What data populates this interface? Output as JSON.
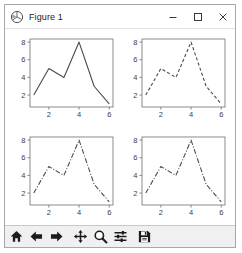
{
  "window": {
    "title": "Figure 1",
    "app_icon": "matplotlib-logo-icon",
    "controls": {
      "minimize": "Minimize",
      "maximize": "Maximize",
      "close": "Close"
    }
  },
  "toolbar": {
    "buttons": [
      {
        "name": "home-button",
        "icon": "home-icon",
        "label": "Home"
      },
      {
        "name": "back-button",
        "icon": "arrow-left-icon",
        "label": "Back"
      },
      {
        "name": "forward-button",
        "icon": "arrow-right-icon",
        "label": "Forward"
      },
      {
        "name": "pan-button",
        "icon": "move-cross-icon",
        "label": "Pan"
      },
      {
        "name": "zoom-button",
        "icon": "magnifier-icon",
        "label": "Zoom"
      },
      {
        "name": "configure-subplots-button",
        "icon": "sliders-icon",
        "label": "Configure subplots"
      },
      {
        "name": "save-button",
        "icon": "floppy-disk-icon",
        "label": "Save"
      }
    ]
  },
  "colors": {
    "line": "#4a4a4a",
    "axis": "#6e6e6e",
    "tick_label": "#3c3c3c",
    "figure_background": "#ffffff",
    "toolbar_background": "#f0f0f0",
    "window_border": "#a8a8a8"
  },
  "chart_data": [
    {
      "type": "line",
      "title": "",
      "subplot_position": "top-left",
      "linestyle": "solid",
      "color": "#4a4a4a",
      "x": [
        1,
        2,
        3,
        4,
        5,
        6
      ],
      "values": [
        2,
        5,
        4,
        8,
        3,
        1
      ],
      "xlabel": "",
      "ylabel": "",
      "xlim": [
        0.75,
        6.25
      ],
      "ylim": [
        0.65,
        8.35
      ],
      "xticks": [
        2,
        4,
        6
      ],
      "yticks": [
        2,
        4,
        6,
        8
      ],
      "xticklabels": [
        "2",
        "4",
        "6"
      ],
      "yticklabels": [
        "2",
        "4",
        "6",
        "8"
      ],
      "grid": false,
      "legend": null
    },
    {
      "type": "line",
      "title": "",
      "subplot_position": "top-right",
      "linestyle": "dashed",
      "color": "#4a4a4a",
      "x": [
        1,
        2,
        3,
        4,
        5,
        6
      ],
      "values": [
        2,
        5,
        4,
        8,
        3,
        1
      ],
      "xlabel": "",
      "ylabel": "",
      "xlim": [
        0.75,
        6.25
      ],
      "ylim": [
        0.65,
        8.35
      ],
      "xticks": [
        2,
        4,
        6
      ],
      "yticks": [
        2,
        4,
        6,
        8
      ],
      "xticklabels": [
        "2",
        "4",
        "6"
      ],
      "yticklabels": [
        "2",
        "4",
        "6",
        "8"
      ],
      "grid": false,
      "legend": null
    },
    {
      "type": "line",
      "title": "",
      "subplot_position": "bottom-left",
      "linestyle": "dashdot",
      "color": "#4a4a4a",
      "x": [
        1,
        2,
        3,
        4,
        5,
        6
      ],
      "values": [
        2,
        5,
        4,
        8,
        3,
        1
      ],
      "xlabel": "",
      "ylabel": "",
      "xlim": [
        0.75,
        6.25
      ],
      "ylim": [
        0.65,
        8.35
      ],
      "xticks": [
        2,
        4,
        6
      ],
      "yticks": [
        2,
        4,
        6,
        8
      ],
      "xticklabels": [
        "2",
        "4",
        "6"
      ],
      "yticklabels": [
        "2",
        "4",
        "6",
        "8"
      ],
      "grid": false,
      "legend": null
    },
    {
      "type": "line",
      "title": "",
      "subplot_position": "bottom-right",
      "linestyle": "dashdot",
      "color": "#4a4a4a",
      "x": [
        1,
        2,
        3,
        4,
        5,
        6
      ],
      "values": [
        2,
        5,
        4,
        8,
        3,
        1
      ],
      "xlabel": "",
      "ylabel": "",
      "xlim": [
        0.75,
        6.25
      ],
      "ylim": [
        0.65,
        8.35
      ],
      "xticks": [
        2,
        4,
        6
      ],
      "yticks": [
        2,
        4,
        6,
        8
      ],
      "xticklabels": [
        "2",
        "4",
        "6"
      ],
      "yticklabels": [
        "2",
        "4",
        "6",
        "8"
      ],
      "grid": false,
      "legend": null
    }
  ]
}
